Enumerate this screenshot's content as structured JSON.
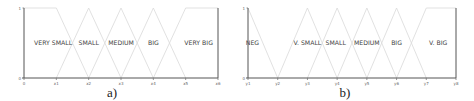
{
  "chart_data": [
    {
      "type": "line",
      "subtype": "fuzzy-membership-functions",
      "caption": "a)",
      "ylim": [
        0,
        1
      ],
      "yticks": [
        "0",
        "1"
      ],
      "xticks": [
        "0",
        "x1",
        "x2",
        "x3",
        "x4",
        "x5",
        "x6"
      ],
      "grid": false,
      "series": [
        {
          "name": "VERY SMALL",
          "points": [
            [
              0,
              1
            ],
            [
              1,
              1
            ],
            [
              2,
              0
            ]
          ]
        },
        {
          "name": "SMALL",
          "points": [
            [
              1,
              0
            ],
            [
              2,
              1
            ],
            [
              3,
              0
            ]
          ]
        },
        {
          "name": "MEDIUM",
          "points": [
            [
              2,
              0
            ],
            [
              3,
              1
            ],
            [
              4,
              0
            ]
          ]
        },
        {
          "name": "BIG",
          "points": [
            [
              3,
              0
            ],
            [
              4,
              1
            ],
            [
              5,
              0
            ]
          ]
        },
        {
          "name": "VERY BIG",
          "points": [
            [
              4,
              0
            ],
            [
              5,
              1
            ],
            [
              6,
              1
            ]
          ]
        }
      ],
      "labels": [
        {
          "text": "VERY SMALL",
          "x": 0.9
        },
        {
          "text": "SMALL",
          "x": 2.0
        },
        {
          "text": "MEDIUM",
          "x": 3.0
        },
        {
          "text": "BIG",
          "x": 4.0
        },
        {
          "text": "VERY BIG",
          "x": 5.4
        }
      ]
    },
    {
      "type": "line",
      "subtype": "fuzzy-membership-functions",
      "caption": "b)",
      "ylim": [
        0,
        1
      ],
      "yticks": [
        "0",
        "1"
      ],
      "xticks": [
        "y1",
        "y2",
        "y3",
        "y4",
        "y5",
        "y6",
        "y7",
        "y8"
      ],
      "grid": false,
      "series": [
        {
          "name": "NEG",
          "points": [
            [
              0,
              1
            ],
            [
              1,
              0
            ]
          ]
        },
        {
          "name": "V. SMALL",
          "points": [
            [
              1,
              0
            ],
            [
              2,
              1
            ],
            [
              3,
              0
            ]
          ]
        },
        {
          "name": "SMALL",
          "points": [
            [
              2,
              0
            ],
            [
              3,
              1
            ],
            [
              4,
              0
            ]
          ]
        },
        {
          "name": "MEDIUM",
          "points": [
            [
              3,
              0
            ],
            [
              4,
              1
            ],
            [
              5,
              0
            ]
          ]
        },
        {
          "name": "BIG",
          "points": [
            [
              4,
              0
            ],
            [
              5,
              1
            ],
            [
              6,
              0
            ]
          ]
        },
        {
          "name": "V. BIG",
          "points": [
            [
              5,
              0
            ],
            [
              6,
              1
            ],
            [
              7,
              1
            ]
          ]
        }
      ],
      "labels": [
        {
          "text": "NEG",
          "x": 0.15
        },
        {
          "text": "V. SMALL",
          "x": 2.0
        },
        {
          "text": "SMALL",
          "x": 2.95
        },
        {
          "text": "MEDIUM",
          "x": 4.0
        },
        {
          "text": "BIG",
          "x": 5.0
        },
        {
          "text": "V. BIG",
          "x": 6.4
        }
      ]
    }
  ]
}
